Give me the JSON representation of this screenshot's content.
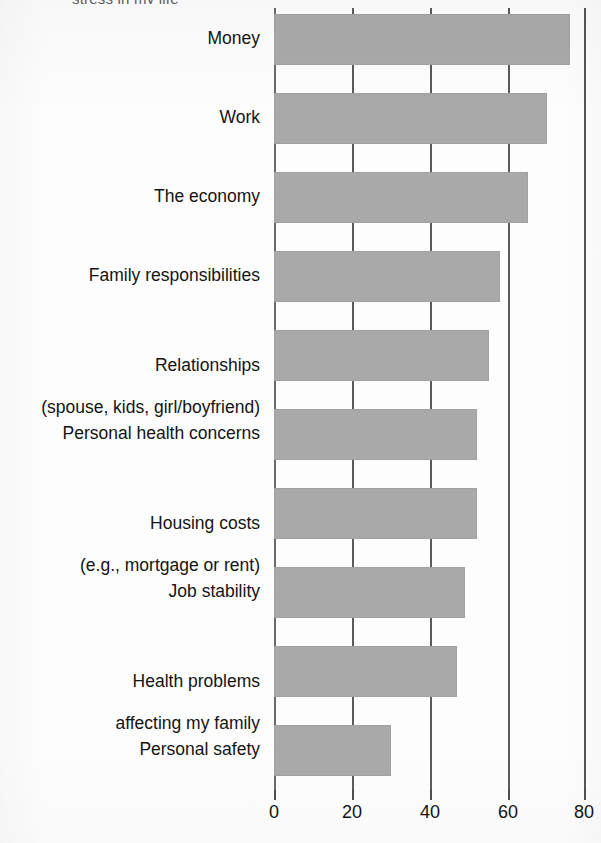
{
  "figure": {
    "clipped_title_fragment": "stress in my life",
    "bar_color": "#a9a9a9",
    "axis_color": "#5a5a5a",
    "text_color": "#141414",
    "background": "#fdfdfd"
  },
  "chart_data": {
    "type": "bar",
    "orientation": "horizontal",
    "title": "",
    "subtitle": "",
    "xlabel": "",
    "ylabel": "",
    "xlim": [
      0,
      80
    ],
    "grid": true,
    "legend": false,
    "xticks": [
      0,
      20,
      40,
      60,
      80
    ],
    "xtick_labels": [
      "0",
      "20",
      "40",
      "60",
      "80"
    ],
    "categories": [
      "Money",
      "Work",
      "The economy",
      "Family responsibilities",
      "Relationships\n(spouse, kids, girl/boyfriend)",
      "Personal health concerns",
      "Housing costs\n(e.g., mortgage or rent)",
      "Job stability",
      "Health problems\naffecting my family",
      "Personal safety"
    ],
    "values": [
      76,
      70,
      65,
      58,
      55,
      52,
      52,
      49,
      47,
      30
    ],
    "series": [
      {
        "name": "Percent reporting source of stress",
        "values": [
          76,
          70,
          65,
          58,
          55,
          52,
          52,
          49,
          47,
          30
        ]
      }
    ]
  },
  "axis": {
    "tick_0": "0",
    "tick_20": "20",
    "tick_40": "40",
    "tick_60": "60",
    "tick_80": "80"
  },
  "labels": {
    "c0": "Money",
    "c1": "Work",
    "c2": "The economy",
    "c3": "Family responsibilities",
    "c4_line1": "Relationships",
    "c4_line2": "(spouse, kids, girl/boyfriend)",
    "c5": "Personal health concerns",
    "c6_line1": "Housing costs",
    "c6_line2": "(e.g., mortgage or rent)",
    "c7": "Job stability",
    "c8_line1": "Health problems",
    "c8_line2": "affecting my family",
    "c9": "Personal safety"
  }
}
